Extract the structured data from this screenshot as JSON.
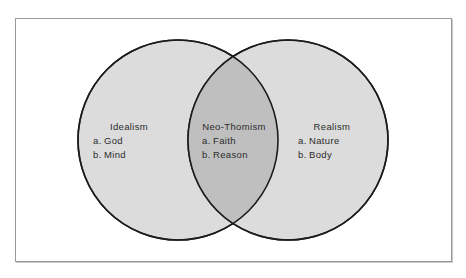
{
  "diagram": {
    "type": "venn",
    "title": "",
    "frame": {
      "border_color": "#9a9a9a",
      "background": "#ffffff"
    },
    "colors": {
      "circle_fill": "#dcdcdc",
      "intersection_fill": "#bfbfbf",
      "outline": "#1c1c1c",
      "text": "#2b2b2b",
      "page_background": "#ffffff"
    },
    "circles": [
      {
        "name": "left-circle",
        "cx": 178,
        "cy": 140,
        "r": 100
      },
      {
        "name": "right-circle",
        "cx": 288,
        "cy": 140,
        "r": 100
      }
    ],
    "sets": [
      {
        "id": "idealism",
        "region": "left",
        "heading": "Idealism",
        "items": [
          {
            "marker": "a.",
            "label": "God"
          },
          {
            "marker": "b.",
            "label": "Mind"
          }
        ]
      },
      {
        "id": "neo-thomism",
        "region": "intersection",
        "heading": "Neo-Thomism",
        "items": [
          {
            "marker": "a.",
            "label": "Faith"
          },
          {
            "marker": "b.",
            "label": "Reason"
          }
        ]
      },
      {
        "id": "realism",
        "region": "right",
        "heading": "Realism",
        "items": [
          {
            "marker": "a.",
            "label": "Nature"
          },
          {
            "marker": "b.",
            "label": "Body"
          }
        ]
      }
    ]
  }
}
